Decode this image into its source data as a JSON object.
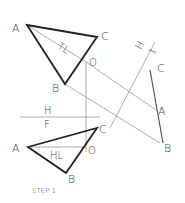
{
  "diagram": {
    "title": "STEP 1",
    "top_view": {
      "vertices": {
        "A": "A",
        "B": "B",
        "C": "C",
        "O": "O"
      },
      "line_label": "TL"
    },
    "fold_lines": {
      "hf": {
        "upper": "H",
        "lower": "F"
      },
      "h1": {
        "upper": "H",
        "lower": "1"
      }
    },
    "edge_view": {
      "labels": {
        "C": "C",
        "A": "A",
        "B": "B"
      }
    },
    "front_view": {
      "vertices": {
        "A": "A",
        "B": "B",
        "C": "C",
        "O": "O"
      },
      "line_label": "HL"
    },
    "colors": {
      "object_line": "#222222",
      "construction_line": "#9a9a9a",
      "text": "#444444"
    }
  }
}
